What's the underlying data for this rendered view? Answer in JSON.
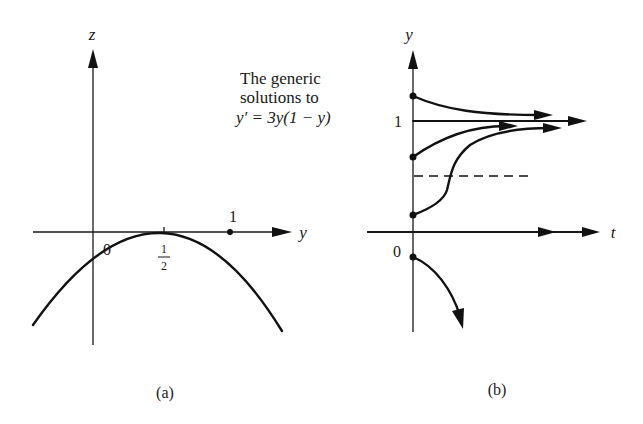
{
  "caption": {
    "line1": "The generic",
    "line2": "solutions to",
    "line3": "y′ = 3y(1 − y)"
  },
  "panel_a": {
    "label": "(a)",
    "vertical_axis_label": "z",
    "horizontal_axis_label": "y",
    "curve": "z = 3y(1 − y)",
    "tick_labels": {
      "zero": "0",
      "half_num": "1",
      "half_den": "2",
      "one": "1"
    },
    "equilibria": [
      0,
      1
    ]
  },
  "panel_b": {
    "label": "(b)",
    "vertical_axis_label": "y",
    "horizontal_axis_label": "t",
    "tick_labels": {
      "one": "1",
      "zero": "0"
    },
    "dashed_level": 0.5,
    "solutions": [
      {
        "name": "above-one",
        "initial_y": 1.3,
        "behavior": "decreases to 1"
      },
      {
        "name": "equilibrium-one",
        "initial_y": 1,
        "behavior": "constant"
      },
      {
        "name": "between-half-and-one",
        "initial_y": 0.72,
        "behavior": "increases to 1"
      },
      {
        "name": "between-zero-and-half",
        "initial_y": 0.17,
        "behavior": "S-shaped, increases to 1"
      },
      {
        "name": "equilibrium-zero",
        "initial_y": 0,
        "behavior": "constant"
      },
      {
        "name": "below-zero",
        "initial_y": -0.25,
        "behavior": "decreases to -infinity"
      }
    ]
  }
}
